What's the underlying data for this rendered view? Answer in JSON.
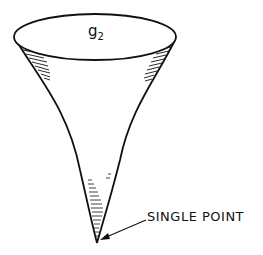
{
  "diagram": {
    "type": "cone",
    "top_label": "g",
    "top_label_subscript": "2",
    "annotation": "SINGLE POINT",
    "colors": {
      "stroke": "#111111",
      "background": "#ffffff"
    }
  }
}
